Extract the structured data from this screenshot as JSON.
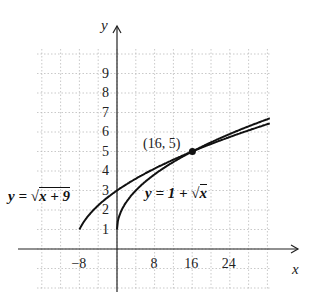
{
  "chart_data": {
    "type": "line",
    "title": "",
    "xlabel": "x",
    "ylabel": "y",
    "xlim": [
      -10,
      33
    ],
    "ylim": [
      -2,
      10
    ],
    "grid": true,
    "x_ticks": [
      "-8",
      "8",
      "16",
      "24"
    ],
    "y_ticks": [
      "1",
      "2",
      "3",
      "4",
      "5",
      "6",
      "7",
      "8",
      "9"
    ],
    "series": [
      {
        "name": "y = √(x + 9)",
        "label": "y = √x + 9",
        "domain": [
          -8,
          32
        ]
      },
      {
        "name": "y = 1 + √x",
        "label": "y = 1 + √x",
        "domain": [
          0,
          32
        ]
      }
    ],
    "annotations": [
      {
        "text": "(16, 5)",
        "x": 16,
        "y": 5,
        "marker": "point"
      }
    ]
  },
  "labels": {
    "x_axis": "x",
    "y_axis": "y",
    "point": "(16, 5)",
    "eq1_prefix": "y = ",
    "eq1_rad": "x + 9",
    "eq2_prefix": "y = 1 + ",
    "eq2_rad": "x"
  }
}
